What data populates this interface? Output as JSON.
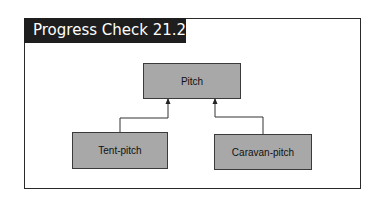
{
  "title": "Progress Check 21.2",
  "diagram": {
    "type": "inheritance",
    "nodes": [
      {
        "id": "pitch",
        "label": "Pitch"
      },
      {
        "id": "tent",
        "label": "Tent-pitch"
      },
      {
        "id": "caravan",
        "label": "Caravan-pitch"
      }
    ],
    "edges": [
      {
        "from": "tent",
        "to": "pitch"
      },
      {
        "from": "caravan",
        "to": "pitch"
      }
    ],
    "colors": {
      "node_fill": "#a8a8a8",
      "title_bg": "#1e1e1e",
      "border": "#2a2a2a"
    }
  }
}
